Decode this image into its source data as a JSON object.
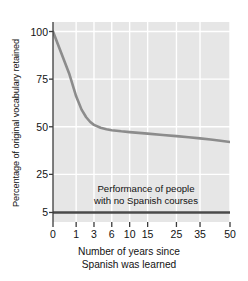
{
  "chart_data": {
    "type": "line",
    "title": "",
    "xlabel": "Number of years since Spanish was learned",
    "ylabel": "Percentage of original vocabulary retained",
    "xlabel_line1": "Number of years since",
    "xlabel_line2": "Spanish was learned",
    "x_ticks": [
      0,
      1,
      3,
      6,
      10,
      15,
      25,
      35,
      50
    ],
    "x_tick_labels": [
      "0",
      "1",
      "3",
      "6",
      "10",
      "15",
      "25",
      "35",
      "50"
    ],
    "y_ticks": [
      5,
      25,
      50,
      75,
      100
    ],
    "y_tick_labels": [
      "5",
      "25",
      "50",
      "75",
      "100"
    ],
    "xlim": [
      0,
      50
    ],
    "ylim": [
      0,
      105
    ],
    "grid": true,
    "legend": "none",
    "series": [
      {
        "name": "Vocabulary retained",
        "color": "#8c8c8c",
        "x": [
          0,
          0.5,
          1,
          1.5,
          2,
          2.5,
          3,
          4,
          5,
          6,
          8,
          10,
          15,
          20,
          25,
          30,
          35,
          40,
          45,
          50
        ],
        "values": [
          100,
          78,
          66,
          59,
          55,
          52.5,
          51,
          49.5,
          48.7,
          48.2,
          47.6,
          47.2,
          46.4,
          45.7,
          45.1,
          44.5,
          43.9,
          43.3,
          42.7,
          42
        ]
      },
      {
        "name": "Performance of people with no Spanish courses",
        "color": "#4a4a4a",
        "x": [
          0,
          50
        ],
        "values": [
          5,
          5
        ]
      }
    ],
    "annotations": [
      {
        "text": "Performance of people with no Spanish courses",
        "line1": "Performance of people",
        "line2": "with no Spanish courses",
        "x": 22,
        "y": 14
      }
    ],
    "colors": {
      "plot_background": "#e6e6e6",
      "gridline": "#ffffff",
      "axis": "#3c3c3c",
      "curve": "#8c8c8c",
      "baseline": "#4a4a4a",
      "text": "#121212"
    }
  }
}
